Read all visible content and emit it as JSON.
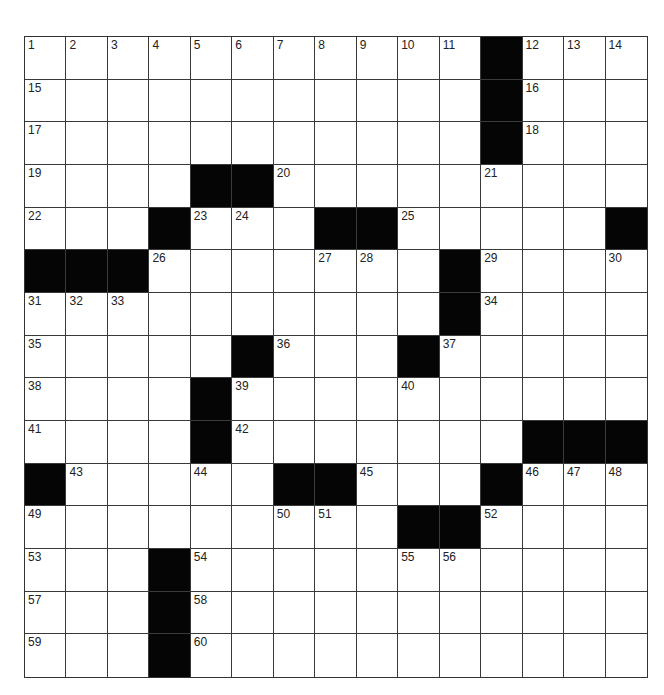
{
  "puzzle": {
    "rows": 15,
    "cols": 15,
    "colors": {
      "block": "#050505",
      "cell": "#ffffff",
      "line": "#3a3a3a",
      "number": "#222222"
    },
    "layout": [
      "1,2,3,4,5,6,7,8,9,10,11,#,12,13,14",
      "15,.,.,.,.,.,.,.,.,.,.,#,16,.,.",
      "17,.,.,.,.,.,.,.,.,.,.,#,18,.,.",
      "19,.,.,.,#,#,20,.,.,.,.,21,.,.,.",
      "22,.,.,#,23,24,.,#,#,25,.,.,.,.,#",
      "#,#,#,26,.,.,.,27,28,.,#,29,.,.,30",
      "31,32,33,.,.,.,.,.,.,.,#,34,.,.,.",
      "35,.,.,.,.,#,36,.,.,#,37,.,.,.,.",
      "38,.,.,.,#,39,.,.,.,40,.,.,.,.,.",
      "41,.,.,.,#,42,.,.,.,.,.,.,#,#,#",
      "#,43,.,.,44,.,#,#,45,.,.,#,46,47,48",
      "49,.,.,.,.,.,50,51,.,#,#,52,.,.,.",
      "53,.,.,#,54,.,.,.,.,55,56,.,.,.,.",
      "57,.,.,#,58,.,.,.,.,.,.,.,.,.,.",
      "59,.,.,#,60,.,.,.,.,.,.,.,.,.,."
    ]
  }
}
